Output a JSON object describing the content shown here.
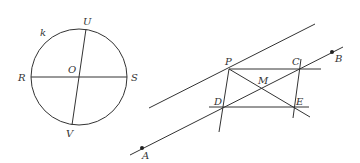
{
  "figure_left": {
    "circle_label": "k",
    "points": {
      "U": "U",
      "V": "V",
      "R": "R",
      "S": "S",
      "O": "O"
    }
  },
  "figure_right": {
    "points": {
      "A": "A",
      "B": "B",
      "P": "P",
      "C": "C",
      "D": "D",
      "E": "E",
      "M": "M"
    }
  },
  "colors": {
    "stroke": "#333333",
    "background": "#ffffff"
  }
}
